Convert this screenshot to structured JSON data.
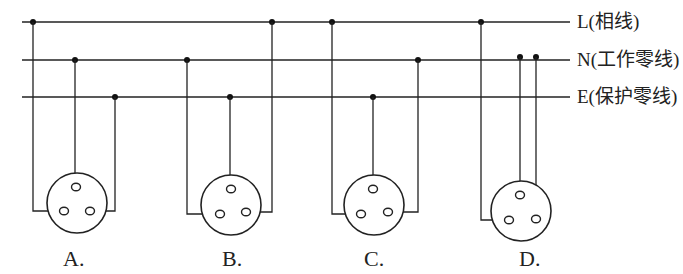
{
  "diagram": {
    "lines": [
      {
        "id": "L",
        "label": "L(相线)",
        "y": 22
      },
      {
        "id": "N",
        "label": "N(工作零线)",
        "y": 60
      },
      {
        "id": "E",
        "label": "E(保护零线)",
        "y": 97
      }
    ],
    "options": [
      {
        "label": "A.",
        "connections": {
          "top": "N",
          "left": "L",
          "right": "E"
        }
      },
      {
        "label": "B.",
        "connections": {
          "top": "E",
          "left": "N",
          "right": "L"
        }
      },
      {
        "label": "C.",
        "connections": {
          "top": "E",
          "left": "L",
          "right": "N"
        }
      },
      {
        "label": "D.",
        "connections": {
          "top": "N",
          "left": "L",
          "right": "N"
        }
      }
    ]
  }
}
